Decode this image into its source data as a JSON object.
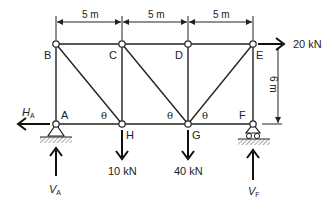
{
  "diagram": {
    "type": "pratt-truss",
    "nodes": {
      "A": {
        "label": "A",
        "x": 56,
        "y": 124
      },
      "B": {
        "label": "B",
        "x": 56,
        "y": 44
      },
      "C": {
        "label": "C",
        "x": 122,
        "y": 44
      },
      "D": {
        "label": "D",
        "x": 188,
        "y": 44
      },
      "E": {
        "label": "E",
        "x": 253,
        "y": 44
      },
      "F": {
        "label": "F",
        "x": 253,
        "y": 124
      },
      "G": {
        "label": "G",
        "x": 188,
        "y": 124
      },
      "H": {
        "label": "H",
        "x": 122,
        "y": 124
      }
    },
    "members": [
      [
        "A",
        "B"
      ],
      [
        "B",
        "C"
      ],
      [
        "C",
        "D"
      ],
      [
        "D",
        "E"
      ],
      [
        "A",
        "H"
      ],
      [
        "H",
        "G"
      ],
      [
        "G",
        "F"
      ],
      [
        "B",
        "H"
      ],
      [
        "C",
        "H"
      ],
      [
        "C",
        "G"
      ],
      [
        "D",
        "G"
      ],
      [
        "E",
        "G"
      ],
      [
        "E",
        "F"
      ]
    ],
    "dimensions": {
      "span_1": "5 m",
      "span_2": "5 m",
      "span_3": "5 m",
      "height": "6 m"
    },
    "loads": {
      "horizontal_E": "20 kN",
      "vertical_H": "10 kN",
      "vertical_G": "40 kN"
    },
    "reactions": {
      "HA_main": "H",
      "HA_sub": "A",
      "VA_main": "V",
      "VA_sub": "A",
      "VF_main": "V",
      "VF_sub": "F"
    },
    "angle_symbol": "θ",
    "supports": {
      "A": "pin",
      "F": "roller"
    }
  }
}
